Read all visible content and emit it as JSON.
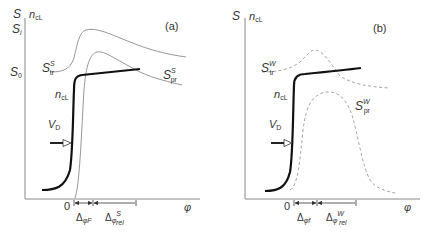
{
  "panels": [
    {
      "id": "a",
      "tag": "(a)",
      "y_axis_label": "S",
      "y_axis_label2": "n",
      "y_axis_label2_sub": "cL",
      "y_ticks": [
        {
          "base": "S",
          "sub": "i"
        },
        {
          "base": "S",
          "sub": "0"
        }
      ],
      "curve_labels": {
        "transport": {
          "base": "S",
          "sup": "S",
          "sub": "tr"
        },
        "production": {
          "base": "S",
          "sup": "S",
          "sub": "pr"
        },
        "ncl": {
          "base": "n",
          "sub": "cL"
        },
        "vd": {
          "base": "V",
          "sub": "D"
        }
      },
      "x_origin": "0",
      "x_axis_label": "φ",
      "intervals": [
        {
          "base": "Δ",
          "sub": "φF",
          "sup": ""
        },
        {
          "base": "Δ",
          "sub": "φ",
          "sup": "S",
          "sub2": "rel"
        }
      ]
    },
    {
      "id": "b",
      "tag": "(b)",
      "y_axis_label": "S",
      "y_axis_label2": "n",
      "y_axis_label2_sub": "cL",
      "curve_labels": {
        "transport": {
          "base": "S",
          "sup": "W",
          "sub": "tr"
        },
        "production": {
          "base": "S",
          "sup": "W",
          "sub": "pr"
        },
        "ncl": {
          "base": "n",
          "sub": "cL"
        },
        "vd": {
          "base": "V",
          "sub": "D"
        }
      },
      "x_origin": "0",
      "x_axis_label": "φ",
      "intervals": [
        {
          "base": "Δ",
          "sub": "φf",
          "sup": ""
        },
        {
          "base": "Δ",
          "sub": "φ",
          "sup": "W",
          "sub2": "rel"
        }
      ]
    }
  ]
}
